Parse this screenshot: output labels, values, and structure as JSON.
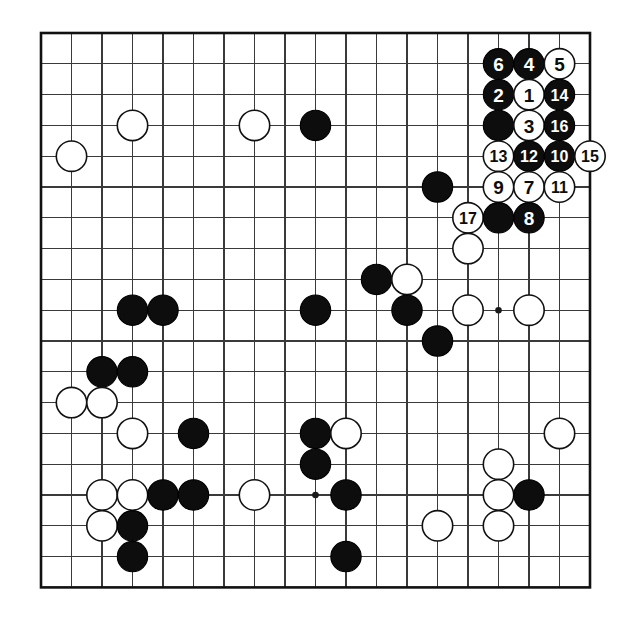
{
  "diagram": {
    "kind": "go-board-diagram",
    "board_size": 19,
    "background_color": "#ffffff",
    "line_color": "#3a3a3a",
    "border_color": "#111111",
    "black_color": "#0d0d0d",
    "white_color": "#ffffff",
    "geometry": {
      "origin_x": 41,
      "origin_y": 33,
      "step_x": 30.5,
      "step_y": 30.8,
      "stone_radius": 15.2
    },
    "star_points": [
      {
        "col": 3,
        "row": 3
      },
      {
        "col": 9,
        "row": 3
      },
      {
        "col": 15,
        "row": 3
      },
      {
        "col": 3,
        "row": 9
      },
      {
        "col": 9,
        "row": 9
      },
      {
        "col": 15,
        "row": 9
      },
      {
        "col": 3,
        "row": 15
      },
      {
        "col": 9,
        "row": 15
      },
      {
        "col": 15,
        "row": 15
      }
    ],
    "move_count": 17,
    "stones": [
      {
        "col": 15,
        "row": 1,
        "color": "black",
        "label": "6"
      },
      {
        "col": 16,
        "row": 1,
        "color": "black",
        "label": "4"
      },
      {
        "col": 17,
        "row": 1,
        "color": "white",
        "label": "5"
      },
      {
        "col": 15,
        "row": 2,
        "color": "black",
        "label": "2"
      },
      {
        "col": 16,
        "row": 2,
        "color": "white",
        "label": "1"
      },
      {
        "col": 17,
        "row": 2,
        "color": "black",
        "label": "14"
      },
      {
        "col": 15,
        "row": 3,
        "color": "black",
        "label": ""
      },
      {
        "col": 16,
        "row": 3,
        "color": "white",
        "label": "3"
      },
      {
        "col": 17,
        "row": 3,
        "color": "black",
        "label": "16"
      },
      {
        "col": 15,
        "row": 4,
        "color": "white",
        "label": "13"
      },
      {
        "col": 16,
        "row": 4,
        "color": "black",
        "label": "12"
      },
      {
        "col": 17,
        "row": 4,
        "color": "black",
        "label": "10"
      },
      {
        "col": 18,
        "row": 4,
        "color": "white",
        "label": "15"
      },
      {
        "col": 15,
        "row": 5,
        "color": "white",
        "label": "9"
      },
      {
        "col": 16,
        "row": 5,
        "color": "white",
        "label": "7"
      },
      {
        "col": 17,
        "row": 5,
        "color": "white",
        "label": "11"
      },
      {
        "col": 13,
        "row": 5,
        "color": "black",
        "label": ""
      },
      {
        "col": 14,
        "row": 6,
        "color": "white",
        "label": "17"
      },
      {
        "col": 15,
        "row": 6,
        "color": "black",
        "label": ""
      },
      {
        "col": 16,
        "row": 6,
        "color": "black",
        "label": "8"
      },
      {
        "col": 14,
        "row": 7,
        "color": "white",
        "label": ""
      },
      {
        "col": 3,
        "row": 3,
        "color": "white",
        "label": ""
      },
      {
        "col": 7,
        "row": 3,
        "color": "white",
        "label": ""
      },
      {
        "col": 9,
        "row": 3,
        "color": "black",
        "label": ""
      },
      {
        "col": 1,
        "row": 4,
        "color": "white",
        "label": ""
      },
      {
        "col": 11,
        "row": 8,
        "color": "black",
        "label": ""
      },
      {
        "col": 12,
        "row": 8,
        "color": "white",
        "label": ""
      },
      {
        "col": 3,
        "row": 9,
        "color": "black",
        "label": ""
      },
      {
        "col": 4,
        "row": 9,
        "color": "black",
        "label": ""
      },
      {
        "col": 9,
        "row": 9,
        "color": "black",
        "label": ""
      },
      {
        "col": 12,
        "row": 9,
        "color": "black",
        "label": ""
      },
      {
        "col": 14,
        "row": 9,
        "color": "white",
        "label": ""
      },
      {
        "col": 16,
        "row": 9,
        "color": "white",
        "label": ""
      },
      {
        "col": 13,
        "row": 10,
        "color": "black",
        "label": ""
      },
      {
        "col": 2,
        "row": 11,
        "color": "black",
        "label": ""
      },
      {
        "col": 3,
        "row": 11,
        "color": "black",
        "label": ""
      },
      {
        "col": 1,
        "row": 12,
        "color": "white",
        "label": ""
      },
      {
        "col": 2,
        "row": 12,
        "color": "white",
        "label": ""
      },
      {
        "col": 3,
        "row": 13,
        "color": "white",
        "label": ""
      },
      {
        "col": 5,
        "row": 13,
        "color": "black",
        "label": ""
      },
      {
        "col": 9,
        "row": 13,
        "color": "black",
        "label": ""
      },
      {
        "col": 10,
        "row": 13,
        "color": "white",
        "label": ""
      },
      {
        "col": 17,
        "row": 13,
        "color": "white",
        "label": ""
      },
      {
        "col": 9,
        "row": 14,
        "color": "black",
        "label": ""
      },
      {
        "col": 15,
        "row": 14,
        "color": "white",
        "label": ""
      },
      {
        "col": 2,
        "row": 15,
        "color": "white",
        "label": ""
      },
      {
        "col": 3,
        "row": 15,
        "color": "white",
        "label": ""
      },
      {
        "col": 4,
        "row": 15,
        "color": "black",
        "label": ""
      },
      {
        "col": 5,
        "row": 15,
        "color": "black",
        "label": ""
      },
      {
        "col": 7,
        "row": 15,
        "color": "white",
        "label": ""
      },
      {
        "col": 10,
        "row": 15,
        "color": "black",
        "label": ""
      },
      {
        "col": 15,
        "row": 15,
        "color": "white",
        "label": ""
      },
      {
        "col": 16,
        "row": 15,
        "color": "black",
        "label": ""
      },
      {
        "col": 2,
        "row": 16,
        "color": "white",
        "label": ""
      },
      {
        "col": 3,
        "row": 16,
        "color": "black",
        "label": ""
      },
      {
        "col": 13,
        "row": 16,
        "color": "white",
        "label": ""
      },
      {
        "col": 15,
        "row": 16,
        "color": "white",
        "label": ""
      },
      {
        "col": 3,
        "row": 17,
        "color": "black",
        "label": ""
      },
      {
        "col": 10,
        "row": 17,
        "color": "black",
        "label": ""
      }
    ]
  }
}
